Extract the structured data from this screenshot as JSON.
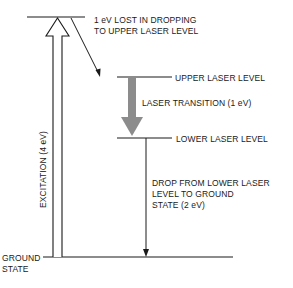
{
  "diagram": {
    "type": "energy-level-diagram",
    "levels": [
      {
        "id": "top",
        "label": "",
        "energy_ev": 4
      },
      {
        "id": "upper",
        "label": "UPPER LASER LEVEL",
        "energy_ev": 3
      },
      {
        "id": "lower",
        "label": "LOWER LASER LEVEL",
        "energy_ev": 2
      },
      {
        "id": "ground",
        "label_line1": "GROUND",
        "label_line2": "STATE",
        "energy_ev": 0
      }
    ],
    "transitions": {
      "excitation": "EXCITATION (4 eV)",
      "loss_line1": "1 eV LOST IN DROPPING",
      "loss_line2": "TO UPPER LASER LEVEL",
      "laser": "LASER TRANSITION (1 eV)",
      "drop_line1": "DROP FROM LOWER LASER",
      "drop_line2": "LEVEL TO GROUND",
      "drop_line3": "STATE (2 eV)"
    },
    "colors": {
      "line": "#1a1a1a",
      "laser_arrow": "#8c8c8c",
      "background": "#ffffff"
    }
  }
}
